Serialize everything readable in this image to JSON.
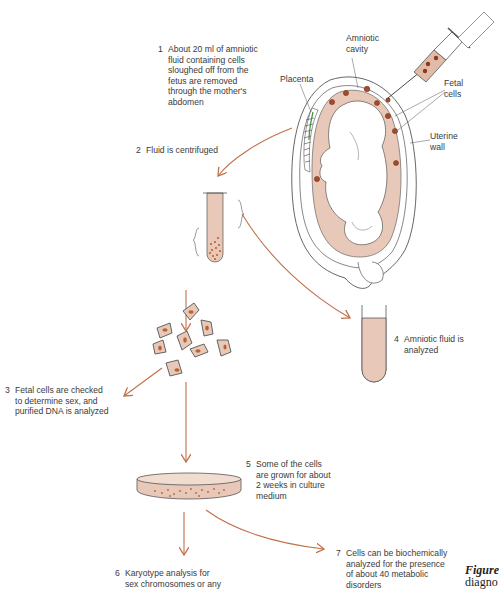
{
  "figure": {
    "colors": {
      "arrow": "#c0704a",
      "fluid": "#e8c8b8",
      "cell_fill": "#e6c9b9",
      "nucleus": "#c0622e",
      "outline": "#555555",
      "placenta_accent": "#3f8f3f"
    },
    "labels": {
      "amniotic_cavity": "Amniotic\ncavity",
      "placenta": "Placenta",
      "fetal_cells": "Fetal\ncells",
      "uterine_wall": "Uterine\nwall"
    },
    "steps": [
      {
        "num": "1",
        "text": "About 20 ml of amniotic\nfluid containing cells\nsloughed off from the\nfetus are removed\nthrough the mother's\nabdomen"
      },
      {
        "num": "2",
        "text": "Fluid is centrifuged"
      },
      {
        "num": "3",
        "text": "Fetal cells are checked\nto determine sex, and\npurified DNA is analyzed"
      },
      {
        "num": "4",
        "text": "Amniotic fluid is\nanalyzed"
      },
      {
        "num": "5",
        "text": "Some of the cells\nare grown for about\n2 weeks in culture\nmedium"
      },
      {
        "num": "6",
        "text": "Karyotype analysis for\nsex chromosomes or any"
      },
      {
        "num": "7",
        "text": "Cells can be biochemically\nanalyzed for the presence\nof about 40 metabolic\ndisorders"
      }
    ],
    "caption": {
      "label": "Figure",
      "text": "diagno"
    }
  }
}
